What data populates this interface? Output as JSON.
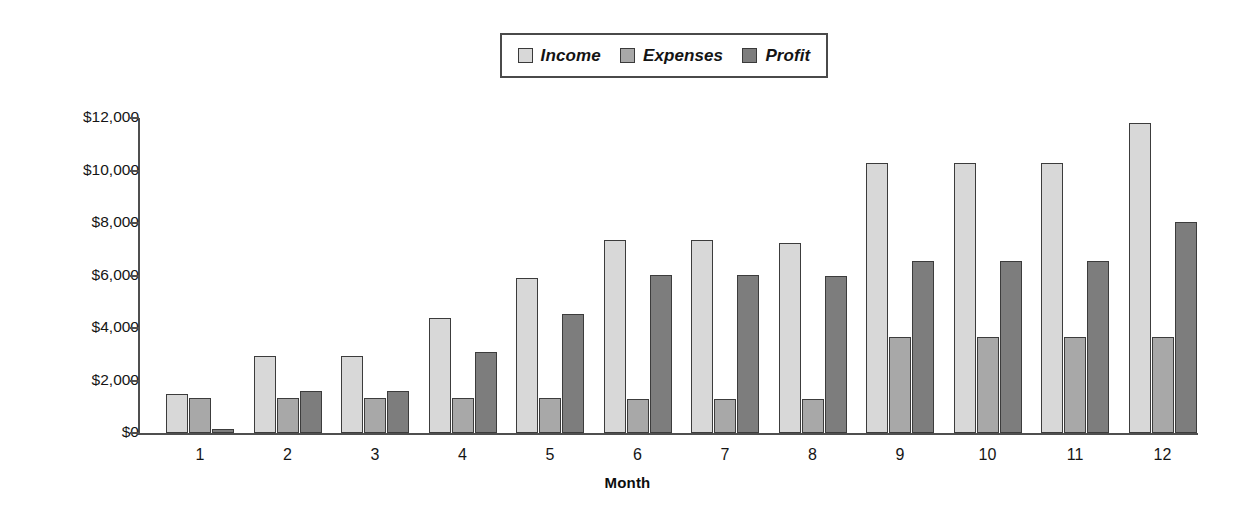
{
  "chart_data": {
    "type": "bar",
    "title": "",
    "xlabel": "Month",
    "ylabel": "",
    "categories": [
      "1",
      "2",
      "3",
      "4",
      "5",
      "6",
      "7",
      "8",
      "9",
      "10",
      "11",
      "12"
    ],
    "series": [
      {
        "name": "Income",
        "color": "#d8d8d8",
        "values": [
          1500,
          2950,
          2950,
          4400,
          5900,
          7350,
          7350,
          7250,
          10300,
          10300,
          10300,
          11800
        ]
      },
      {
        "name": "Expenses",
        "color": "#a8a8a8",
        "values": [
          1330,
          1330,
          1330,
          1330,
          1330,
          1300,
          1280,
          1280,
          3650,
          3650,
          3650,
          3640
        ]
      },
      {
        "name": "Profit",
        "color": "#7d7d7d",
        "values": [
          150,
          1600,
          1600,
          3100,
          4550,
          6030,
          6030,
          6000,
          6550,
          6550,
          6550,
          8050
        ]
      }
    ],
    "ylim": [
      0,
      12000
    ],
    "ytick_values": [
      0,
      2000,
      4000,
      6000,
      8000,
      10000,
      12000
    ],
    "ytick_labels": [
      "$0",
      "$2,000",
      "$4,000",
      "$6,000",
      "$8,000",
      "$10,000",
      "$12,000"
    ],
    "grid": false,
    "legend_position": "top-center",
    "axis_color": "#4f4f4f",
    "bar_border_color": "#3c3c3c",
    "background": "#ffffff"
  },
  "legend": {
    "items": [
      {
        "label": "Income",
        "color": "#d8d8d8"
      },
      {
        "label": "Expenses",
        "color": "#a8a8a8"
      },
      {
        "label": "Profit",
        "color": "#7d7d7d"
      }
    ]
  },
  "axes": {
    "x_title": "Month"
  }
}
